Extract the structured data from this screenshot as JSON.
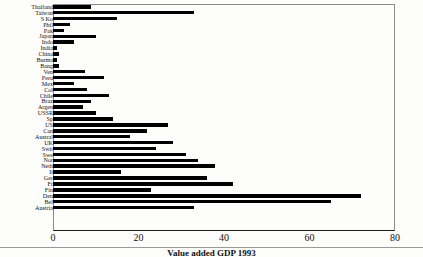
{
  "chart_data": {
    "type": "bar",
    "orientation": "horizontal",
    "title": "",
    "xlabel": "",
    "ylabel": "",
    "xlim": [
      0,
      80
    ],
    "xticks": [
      "0",
      "20",
      "40",
      "60",
      "80"
    ],
    "xtick_values": [
      0,
      20,
      40,
      60,
      80
    ],
    "grid": false,
    "legend": false,
    "bar_color": "#000000",
    "categories": [
      "Thailand",
      "Taiwan",
      "S Ko",
      "Phil",
      "Pak",
      "Japan",
      "Indo",
      "India",
      "China",
      "Burma",
      "Bang",
      "Ven",
      "Peru",
      "Mex",
      "Col",
      "Chile",
      "Braz",
      "Argen",
      "USSR",
      "Sp",
      "US",
      "Can",
      "Austral",
      "UK",
      "Swit",
      "Swe",
      "Nor",
      "Neth",
      "It",
      "Ger",
      "Fr",
      "Fin",
      "Den",
      "Bel",
      "Austria"
    ],
    "values": [
      9,
      33,
      15,
      4,
      2.5,
      10,
      5,
      1,
      1.5,
      1,
      1.5,
      7.5,
      12,
      5,
      8,
      13,
      9,
      7,
      10,
      14,
      27,
      22,
      18,
      28,
      24,
      31,
      34,
      38,
      16,
      36,
      42,
      23,
      72,
      65,
      33
    ]
  },
  "axis": {
    "tick_0": "0",
    "tick_20": "20",
    "tick_40": "40",
    "tick_60": "60",
    "tick_80": "80"
  },
  "caption": {
    "text": "Value added GDP 1993"
  }
}
